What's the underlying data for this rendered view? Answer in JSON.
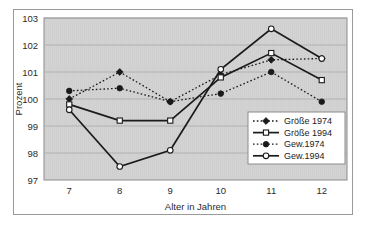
{
  "chart_data": {
    "type": "line",
    "title": "",
    "xlabel": "Alter in Jahren",
    "ylabel": "Prozent",
    "categories": [
      "7",
      "8",
      "9",
      "10",
      "11",
      "12"
    ],
    "x": [
      7,
      8,
      9,
      10,
      11,
      12
    ],
    "xlim": [
      6.5,
      12.5
    ],
    "ylim": [
      97,
      103
    ],
    "yticks": [
      "97",
      "98",
      "99",
      "100",
      "101",
      "102",
      "103"
    ],
    "grid": true,
    "grid_axis": "y",
    "legend_position": "bottom-right",
    "plot_background": "#d3d3d3",
    "series": [
      {
        "name": "Größe 1974",
        "values": [
          100.0,
          101.0,
          99.9,
          100.9,
          101.45,
          101.5
        ],
        "line_style": "dotted",
        "marker": "filled-diamond",
        "color": "#1a1a1a"
      },
      {
        "name": "Größe 1994",
        "values": [
          99.8,
          99.2,
          99.2,
          100.8,
          101.7,
          100.7
        ],
        "line_style": "solid",
        "marker": "open-square",
        "color": "#1a1a1a"
      },
      {
        "name": "Gew.1974",
        "values": [
          100.3,
          100.4,
          99.9,
          100.2,
          101.0,
          99.9
        ],
        "line_style": "dotted",
        "marker": "filled-circle",
        "color": "#1a1a1a"
      },
      {
        "name": "Gew.1994",
        "values": [
          99.6,
          97.5,
          98.1,
          101.1,
          102.6,
          101.5
        ],
        "line_style": "solid",
        "marker": "open-circle",
        "color": "#1a1a1a"
      }
    ]
  }
}
